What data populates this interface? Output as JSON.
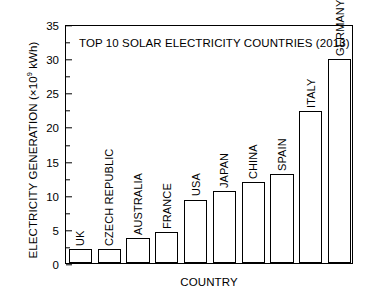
{
  "chart_data": {
    "type": "bar",
    "title": "TOP 10 SOLAR ELECTRICITY COUNTRIES (2013)",
    "xlabel": "COUNTRY",
    "ylabel_text": "ELECTRICITY GENERATION (×10",
    "ylabel_exponent": "9",
    "ylabel_tail": " kWh)",
    "ylabel_full": "ELECTRICITY GENERATION (×10⁹ kWh)",
    "categories": [
      "UK",
      "CZECH REPUBLIC",
      "AUSTRALIA",
      "FRANCE",
      "USA",
      "JAPAN",
      "CHINA",
      "SPAIN",
      "ITALY",
      "GERMANY"
    ],
    "values": [
      2.0,
      2.1,
      3.6,
      4.6,
      9.3,
      10.6,
      11.8,
      13.0,
      22.3,
      29.9
    ],
    "ylim": [
      0,
      35
    ],
    "yticks": [
      0,
      5,
      10,
      15,
      20,
      25,
      30,
      35
    ],
    "ytick_labels": [
      "0",
      "5",
      "10",
      "15",
      "20",
      "25",
      "30",
      "35"
    ],
    "grid": false,
    "legend": false,
    "bar_facecolor": "#ffffff",
    "bar_edgecolor": "#000000",
    "axis_color": "#000000",
    "background": "#ffffff"
  }
}
